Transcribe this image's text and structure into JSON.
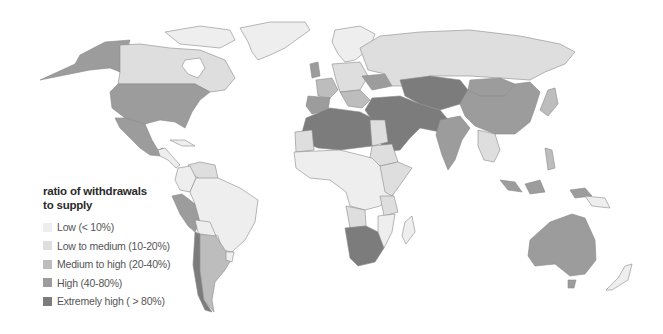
{
  "legend": {
    "title_line1": "ratio of withdrawals",
    "title_line2": "to supply",
    "items": [
      {
        "label": "Low (< 10%)",
        "color": "#eeeeee"
      },
      {
        "label": "Low to medium (10-20%)",
        "color": "#dedede"
      },
      {
        "label": "Medium to high  (20-40%)",
        "color": "#bdbdbd"
      },
      {
        "label": "High (40-80%)",
        "color": "#9c9c9c"
      },
      {
        "label": "Extremely high ( > 80%)",
        "color": "#7c7c7c"
      }
    ]
  },
  "colors": {
    "low": "#eeeeee",
    "low_medium": "#dedede",
    "medium_high": "#bdbdbd",
    "high": "#9c9c9c",
    "extreme": "#7c7c7c",
    "background": "#ffffff"
  }
}
